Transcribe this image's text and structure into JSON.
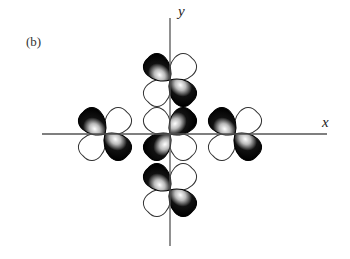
{
  "figure": {
    "panel_label": "(b)",
    "axes": {
      "x_label": "x",
      "y_label": "y",
      "origin": [
        170,
        134
      ],
      "x_axis": {
        "from": 42,
        "to": 327
      },
      "y_axis": {
        "from": 18,
        "to": 246
      },
      "color": "#555555"
    },
    "lobe_colors": {
      "positive": "#111111",
      "negative": "#ffffff",
      "highlight": "#ffffff",
      "outline": "#333333"
    },
    "orbitals": [
      {
        "name": "center",
        "cx": 170,
        "cy": 134,
        "phases": [
          "white",
          "black",
          "black",
          "white"
        ]
      },
      {
        "name": "top",
        "cx": 170,
        "cy": 80,
        "phases": [
          "black",
          "white",
          "white",
          "black"
        ]
      },
      {
        "name": "bottom",
        "cx": 170,
        "cy": 190,
        "phases": [
          "black",
          "white",
          "white",
          "black"
        ]
      },
      {
        "name": "left",
        "cx": 105,
        "cy": 134,
        "phases": [
          "black",
          "white",
          "white",
          "black"
        ]
      },
      {
        "name": "right",
        "cx": 235,
        "cy": 134,
        "phases": [
          "black",
          "white",
          "white",
          "black"
        ]
      }
    ]
  }
}
